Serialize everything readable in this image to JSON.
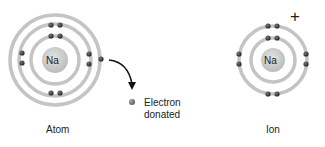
{
  "atom": {
    "symbol": "Na",
    "label": "Atom"
  },
  "ion": {
    "symbol": "Na",
    "label": "Ion",
    "charge": "+"
  },
  "donated": {
    "line1": "Electron",
    "line2": "donated"
  },
  "colors": {
    "ring": "#bdbdbd",
    "nucleus": "#c8c8c8",
    "electron": "#333333",
    "arrow": "#111111"
  }
}
